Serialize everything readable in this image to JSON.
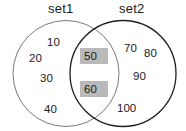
{
  "diagram": {
    "type": "venn",
    "title": "",
    "sets": [
      {
        "id": "set1",
        "label": "set1",
        "stroke_color": "#7a7a7a",
        "members_exclusive": [
          "10",
          "20",
          "30",
          "40"
        ]
      },
      {
        "id": "set2",
        "label": "set2",
        "stroke_color": "#1f1f1f",
        "members_exclusive": [
          "70",
          "80",
          "90",
          "100"
        ]
      }
    ],
    "intersection": {
      "label": "",
      "members": [
        "50",
        "60"
      ],
      "highlight_color": "#b9b9b9"
    },
    "background_color": "#ffffff",
    "text_color": "#1a1a1a"
  },
  "labels": {
    "set1": "set1",
    "set2": "set2"
  },
  "members": {
    "left": {
      "m10": "10",
      "m20": "20",
      "m30": "30",
      "m40": "40"
    },
    "intersection": {
      "m50": "50",
      "m60": "60"
    },
    "right": {
      "m70": "70",
      "m80": "80",
      "m90": "90",
      "m100": "100"
    }
  }
}
